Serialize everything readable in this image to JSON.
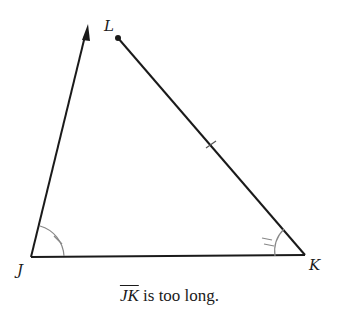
{
  "diagram": {
    "points": {
      "J": {
        "label": "J",
        "x": 31,
        "y": 257
      },
      "K": {
        "label": "K",
        "x": 305,
        "y": 255
      },
      "L": {
        "label": "L",
        "x": 118,
        "y": 38
      },
      "arrow_tip": {
        "x": 88,
        "y": 25
      }
    },
    "segments": [
      "JK",
      "KL",
      "ray from J"
    ],
    "marks": {
      "angle_J": "single arc with single tick",
      "angle_K": "single arc with double tick",
      "segment_KL": "single tick"
    }
  },
  "caption": {
    "segment": "JK",
    "text": " is too long."
  }
}
